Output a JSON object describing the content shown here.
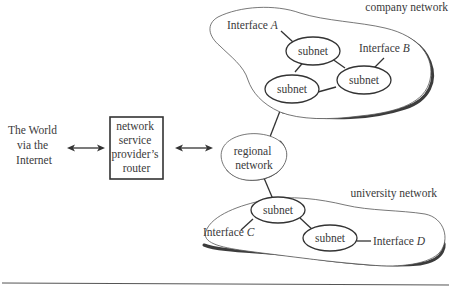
{
  "diagram": {
    "world": {
      "lines": [
        "The World",
        "via the",
        "Internet"
      ]
    },
    "router": {
      "lines": [
        "network",
        "service",
        "provider’s",
        "router"
      ]
    },
    "regional": {
      "lines": [
        "regional",
        "network"
      ]
    },
    "company": {
      "label": "company network",
      "subnets": [
        "subnet",
        "subnet",
        "subnet"
      ],
      "interface_a": {
        "prefix": "Interface ",
        "letter": "A"
      },
      "interface_b": {
        "prefix": "Interface ",
        "letter": "B"
      }
    },
    "university": {
      "label": "university network",
      "subnets": [
        "subnet",
        "subnet"
      ],
      "interface_c": {
        "prefix": "Interface ",
        "letter": "C"
      },
      "interface_d": {
        "prefix": "Interface ",
        "letter": "D"
      }
    },
    "colors": {
      "stroke": "#333333",
      "text": "#3a3a3a",
      "background": "#ffffff"
    }
  }
}
